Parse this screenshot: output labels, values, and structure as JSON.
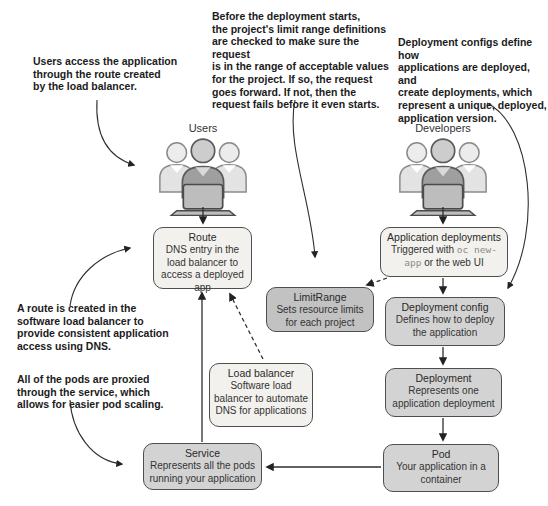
{
  "annotations": {
    "users_access": "Users access the application\nthrough the route created\nby the load balancer.",
    "before_deployment": "Before the deployment starts,\nthe project's limit range definitions\nare checked to make sure the request\nis in the range of acceptable values\nfor the project. If so, the request\ngoes forward. If not, then the\nrequest fails before it even starts.",
    "deployment_configs": "Deployment configs define how\napplications are deployed, and\ncreate deployments, which\nrepresent a unique, deployed,\napplication version.",
    "route_created": "A route is created in the\nsoftware load balancer to\nprovide consistent application\naccess using DNS.",
    "pods_proxied": "All of the pods are proxied\nthrough the service, which\nallows for easier pod scaling."
  },
  "groups": {
    "users": {
      "label": "Users",
      "icon": "people-group-with-laptop-icon"
    },
    "developers": {
      "label": "Developers",
      "icon": "people-group-with-laptop-icon"
    }
  },
  "boxes": {
    "route": {
      "title": "Route",
      "body": "DNS entry in the load balancer to access a deployed app"
    },
    "app_deployments": {
      "title": "Application deployments",
      "body_prefix": "Triggered with ",
      "code": "oc new-app",
      "body_suffix": " or the web UI"
    },
    "limitrange": {
      "title": "LimitRange",
      "body": "Sets resource limits for each project"
    },
    "deployment_config": {
      "title": "Deployment config",
      "body": "Defines how to deploy the application"
    },
    "load_balancer": {
      "title": "Load balancer",
      "body": "Software load balancer to automate DNS for applications"
    },
    "deployment": {
      "title": "Deployment",
      "body": "Represents one application deployment"
    },
    "pod": {
      "title": "Pod",
      "body": "Your application in a container"
    },
    "service": {
      "title": "Service",
      "body": "Represents all the pods running your application"
    }
  },
  "colors": {
    "box_light": "#f2f1ed",
    "box_medium": "#d3d3d3",
    "box_limitrange": "#c2c2c2",
    "box_border": "#4f4f4f",
    "arrow": "#2e2e2e",
    "code_text": "#8a8a8a"
  }
}
